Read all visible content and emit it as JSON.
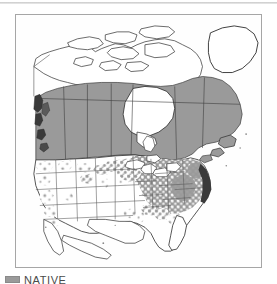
{
  "page": {
    "background_color": "#ffffff",
    "top_rule_color": "#bfbfbf"
  },
  "map": {
    "name": "north-america-distribution-map",
    "frame_border_color": "#a6a6a6",
    "ocean_color": "#fefefe",
    "land_color": "#ffffff",
    "shaded_color": "#9a9a9a",
    "outline_color": "#2b2b2b",
    "state_line_color": "#555555",
    "projection_note": "North America, conic",
    "regions_shaded": [
      "British Columbia",
      "Alberta",
      "Saskatchewan",
      "Manitoba",
      "Ontario",
      "Quebec",
      "Labrador",
      "Newfoundland",
      "Northeastern United States",
      "Great Lakes States",
      "Appalachian States",
      "Mid-Atlantic States",
      "Upper Midwest"
    ],
    "regions_unshaded": [
      "Nunavut",
      "Northwest Territories",
      "Arctic Archipelago",
      "Greenland",
      "Southwestern United States",
      "Great Plains",
      "Florida",
      "Gulf Coast"
    ]
  },
  "legend": {
    "swatch_color": "#9a9a9a",
    "label": "NATIVE"
  }
}
